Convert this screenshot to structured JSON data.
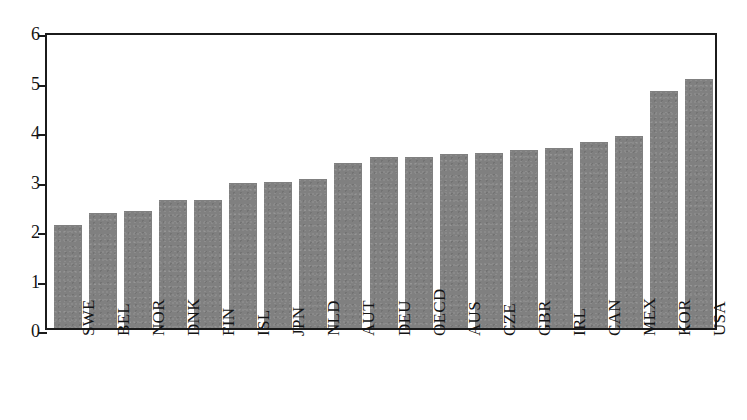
{
  "chart_data": {
    "type": "bar",
    "title": "",
    "subtitle": "",
    "xlabel": "",
    "ylabel": "",
    "ylim": [
      0,
      6
    ],
    "yticks": [
      0,
      1,
      2,
      3,
      4,
      5,
      6
    ],
    "ytick_labels": [
      "0",
      "1",
      "2",
      "3",
      "4",
      "5",
      "6"
    ],
    "grid": false,
    "legend": null,
    "bar_color": "#808080",
    "axis_color": "#1b1b1b",
    "categories": [
      "SWE",
      "BEL",
      "NOR",
      "DNK",
      "FIN",
      "ISL",
      "JPN",
      "NLD",
      "AUT",
      "DEU",
      "OECD",
      "AUS",
      "CZE",
      "GBR",
      "IRL",
      "CAN",
      "MEX",
      "KOR",
      "USA"
    ],
    "values": [
      2.09,
      2.32,
      2.37,
      2.58,
      2.58,
      2.93,
      2.94,
      3.02,
      3.33,
      3.45,
      3.45,
      3.51,
      3.54,
      3.6,
      3.64,
      3.76,
      3.88,
      4.79,
      5.03
    ],
    "series": [
      {
        "name": "",
        "values": [
          2.09,
          2.32,
          2.37,
          2.58,
          2.58,
          2.93,
          2.94,
          3.02,
          3.33,
          3.45,
          3.45,
          3.51,
          3.54,
          3.6,
          3.64,
          3.76,
          3.88,
          4.79,
          5.03
        ]
      }
    ]
  }
}
